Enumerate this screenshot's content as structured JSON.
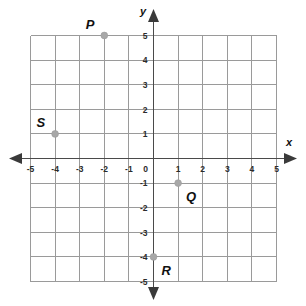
{
  "figure": {
    "axis_labels": {
      "x": "x",
      "y": "y"
    },
    "colors": {
      "background": "#ffffff",
      "grid": "#9a9a9a",
      "axis": "#4a4a4a",
      "point_marker": "#a8a8a8",
      "label_text": "#111111"
    }
  },
  "chart_data": {
    "type": "scatter",
    "title": "",
    "xlabel": "x",
    "ylabel": "y",
    "xlim": [
      -5,
      5
    ],
    "ylim": [
      -5,
      5
    ],
    "grid": true,
    "legend": "none",
    "x_ticks": [
      "-5",
      "-4",
      "-3",
      "-2",
      "-1",
      "0",
      "1",
      "2",
      "3",
      "4",
      "5"
    ],
    "y_ticks": [
      "-5",
      "-4",
      "-3",
      "-2",
      "-1",
      "1",
      "2",
      "3",
      "4",
      "5"
    ],
    "x_tick_values": [
      -5,
      -4,
      -3,
      -2,
      -1,
      0,
      1,
      2,
      3,
      4,
      5
    ],
    "y_tick_values": [
      -5,
      -4,
      -3,
      -2,
      -1,
      1,
      2,
      3,
      4,
      5
    ],
    "points": [
      {
        "label": "P",
        "x": -2,
        "y": 5,
        "label_position": "upper-left"
      },
      {
        "label": "S",
        "x": -4,
        "y": 1,
        "label_position": "upper-left"
      },
      {
        "label": "Q",
        "x": 1,
        "y": -1,
        "label_position": "lower-right"
      },
      {
        "label": "R",
        "x": 0,
        "y": -4,
        "label_position": "lower-right"
      }
    ]
  }
}
